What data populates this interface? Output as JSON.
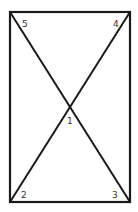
{
  "diagram": {
    "stroke_color": "#1a1a1a",
    "rect": {
      "x1": 10,
      "y1": 12,
      "x2": 130,
      "y2": 202
    },
    "intersection": {
      "x": 70,
      "y": 107
    },
    "labels": [
      {
        "id": "1",
        "text": "1",
        "x": 69,
        "y": 123
      },
      {
        "id": "2",
        "text": "2",
        "x": 22,
        "y": 197
      },
      {
        "id": "3",
        "text": "3",
        "x": 113,
        "y": 197
      },
      {
        "id": "4",
        "text": "4",
        "x": 114,
        "y": 26
      },
      {
        "id": "5",
        "text": "5",
        "x": 23,
        "y": 26
      }
    ]
  }
}
